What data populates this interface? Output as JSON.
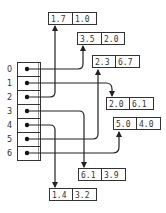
{
  "diagram": {
    "type": "array-of-pointers",
    "array": {
      "indices": [
        "0",
        "1",
        "2",
        "3",
        "4",
        "5",
        "6"
      ]
    },
    "records": [
      {
        "id": "r0",
        "a": "1.7",
        "b": "1.0",
        "x": 48,
        "y": 12
      },
      {
        "id": "r1",
        "a": "3.5",
        "b": "2.0",
        "x": 77,
        "y": 32
      },
      {
        "id": "r2",
        "a": "2.3",
        "b": "6.7",
        "x": 92,
        "y": 55
      },
      {
        "id": "r3",
        "a": "2.0",
        "b": "6.1",
        "x": 106,
        "y": 97
      },
      {
        "id": "r4",
        "a": "5.0",
        "b": "4.0",
        "x": 113,
        "y": 117
      },
      {
        "id": "r5",
        "a": "6.1",
        "b": "3.9",
        "x": 78,
        "y": 168
      },
      {
        "id": "r6",
        "a": "1.4",
        "b": "3.2",
        "x": 49,
        "y": 188
      }
    ],
    "pointers": [
      {
        "from_index": "0",
        "to": "3.5 | 2.0"
      },
      {
        "from_index": "1",
        "to": "2.0 | 6.1"
      },
      {
        "from_index": "2",
        "to": "1.7 | 1.0"
      },
      {
        "from_index": "3",
        "to": "6.1 | 3.9"
      },
      {
        "from_index": "4",
        "to": "1.4 | 3.2"
      },
      {
        "from_index": "5",
        "to": "2.3 | 6.7"
      },
      {
        "from_index": "6",
        "to": "5.0 | 4.0"
      }
    ],
    "colors": {
      "line": "#222222",
      "box_border": "#333333",
      "text": "#333333"
    }
  }
}
